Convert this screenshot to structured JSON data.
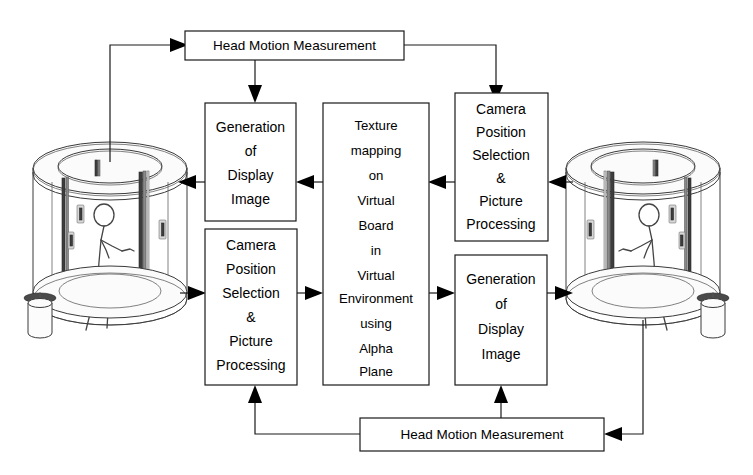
{
  "diagram": {
    "background_color": "#ffffff",
    "line_color": "#1a1a1a",
    "boxes": {
      "head_motion_top": "Head Motion Measurement",
      "head_motion_bottom": "Head Motion Measurement",
      "generation_display_left": [
        "Generation",
        "of",
        "Display",
        "Image"
      ],
      "generation_display_right": [
        "Generation",
        "of",
        "Display",
        "Image"
      ],
      "camera_position_left": [
        "Camera",
        "Position",
        "Selection",
        "&",
        "Picture",
        "Processing"
      ],
      "camera_position_right": [
        "Camera",
        "Position",
        "Selection",
        "&",
        "Picture",
        "Processing"
      ],
      "texture_mapping_center": [
        "Texture",
        "mapping",
        "on",
        "Virtual",
        "Board",
        "in",
        "Virtual",
        "Environment",
        "using",
        "Alpha",
        "Plane"
      ]
    },
    "scenes": {
      "left_booth_name": "cylindrical-display-booth-left",
      "right_booth_name": "cylindrical-display-booth-right",
      "occupant_name": "person-figure"
    },
    "connections": [
      {
        "name": "left-booth-to-head-motion-top",
        "from": "left-booth",
        "to": "head-motion-top",
        "direction": "right"
      },
      {
        "name": "head-motion-top-to-generation-left",
        "from": "head-motion-top",
        "to": "generation-display-left",
        "direction": "down"
      },
      {
        "name": "head-motion-top-to-camera-right",
        "from": "head-motion-top",
        "to": "camera-position-right",
        "direction": "down"
      },
      {
        "name": "generation-left-to-left-booth",
        "from": "generation-display-left",
        "to": "left-booth",
        "direction": "left"
      },
      {
        "name": "texture-to-generation-left",
        "from": "texture-mapping",
        "to": "generation-display-left",
        "direction": "left"
      },
      {
        "name": "camera-right-to-texture",
        "from": "camera-position-right",
        "to": "texture-mapping",
        "direction": "left"
      },
      {
        "name": "right-booth-to-camera-right",
        "from": "right-booth",
        "to": "camera-position-right",
        "direction": "left"
      },
      {
        "name": "left-booth-to-camera-left",
        "from": "left-booth",
        "to": "camera-position-left",
        "direction": "right"
      },
      {
        "name": "camera-left-to-texture",
        "from": "camera-position-left",
        "to": "texture-mapping",
        "direction": "right"
      },
      {
        "name": "texture-to-generation-right",
        "from": "texture-mapping",
        "to": "generation-display-right",
        "direction": "right"
      },
      {
        "name": "generation-right-to-right-booth",
        "from": "generation-display-right",
        "to": "right-booth",
        "direction": "right"
      },
      {
        "name": "right-booth-to-head-motion-bottom",
        "from": "right-booth",
        "to": "head-motion-bottom",
        "direction": "left"
      },
      {
        "name": "head-motion-bottom-to-camera-left",
        "from": "head-motion-bottom",
        "to": "camera-position-left",
        "direction": "up"
      },
      {
        "name": "head-motion-bottom-to-generation-right",
        "from": "head-motion-bottom",
        "to": "generation-display-right",
        "direction": "up"
      }
    ]
  }
}
